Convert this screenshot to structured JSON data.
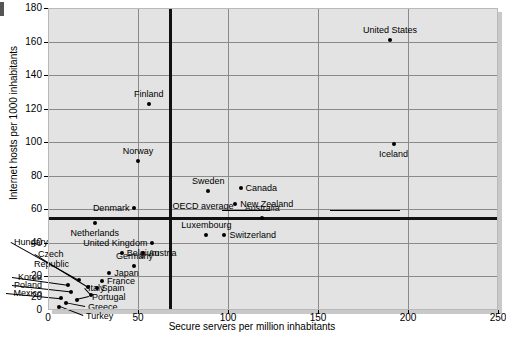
{
  "chart_data": {
    "type": "scatter",
    "title": "",
    "xlabel": "Secure servers per million inhabitants",
    "ylabel": "Internet hosts per 1000 inhabitants",
    "xlim": [
      0,
      250
    ],
    "ylim": [
      0,
      180
    ],
    "xticks": [
      "0",
      "50",
      "100",
      "150",
      "200",
      "250"
    ],
    "xtick_values": [
      0,
      50,
      100,
      150,
      200,
      250
    ],
    "yticks": [
      "0",
      "20",
      "40",
      "60",
      "80",
      "100",
      "120",
      "140",
      "160",
      "180"
    ],
    "ytick_values": [
      0,
      20,
      40,
      60,
      80,
      100,
      120,
      140,
      160,
      180
    ],
    "grid": true,
    "legend": "none",
    "reference_lines": {
      "label": "OECD average",
      "x": 68,
      "y": 55
    },
    "points": [
      {
        "name": "United States",
        "x": 190,
        "y": 161,
        "label_pos": "above"
      },
      {
        "name": "Iceland",
        "x": 192,
        "y": 99,
        "label_pos": "below"
      },
      {
        "name": "Finland",
        "x": 56,
        "y": 123,
        "label_pos": "above"
      },
      {
        "name": "Norway",
        "x": 50,
        "y": 89,
        "label_pos": "above"
      },
      {
        "name": "Sweden",
        "x": 89,
        "y": 71,
        "label_pos": "above"
      },
      {
        "name": "Canada",
        "x": 107,
        "y": 73,
        "label_pos": "right"
      },
      {
        "name": "New Zealand",
        "x": 104,
        "y": 63,
        "label_pos": "right"
      },
      {
        "name": "Australia",
        "x": 119,
        "y": 55,
        "label_pos": "above"
      },
      {
        "name": "Denmark",
        "x": 48,
        "y": 61,
        "label_pos": "left"
      },
      {
        "name": "Netherlands",
        "x": 26,
        "y": 52,
        "label_pos": "below"
      },
      {
        "name": "Luxembourg",
        "x": 88,
        "y": 45,
        "label_pos": "above"
      },
      {
        "name": "Switzerland",
        "x": 98,
        "y": 45,
        "label_pos": "right"
      },
      {
        "name": "United Kingdom",
        "x": 58,
        "y": 40,
        "label_pos": "left"
      },
      {
        "name": "Belgium",
        "x": 41,
        "y": 34,
        "label_pos": "right"
      },
      {
        "name": "Austria",
        "x": 53,
        "y": 34,
        "label_pos": "right"
      },
      {
        "name": "Germany",
        "x": 48,
        "y": 26,
        "label_pos": "above"
      },
      {
        "name": "Hungary",
        "x": 17,
        "y": 18,
        "label_pos": "leader"
      },
      {
        "name": "Czech Republic",
        "x": 22,
        "y": 14,
        "label_pos": "leader"
      },
      {
        "name": "Japan",
        "x": 34,
        "y": 22,
        "label_pos": "right"
      },
      {
        "name": "France",
        "x": 30,
        "y": 17,
        "label_pos": "right"
      },
      {
        "name": "Spain",
        "x": 27,
        "y": 13,
        "label_pos": "right"
      },
      {
        "name": "Italy",
        "x": 24,
        "y": 9,
        "label_pos": "leader"
      },
      {
        "name": "Korea",
        "x": 11,
        "y": 15,
        "label_pos": "leader"
      },
      {
        "name": "Poland",
        "x": 13,
        "y": 11,
        "label_pos": "leader"
      },
      {
        "name": "Mexico",
        "x": 7,
        "y": 7,
        "label_pos": "leader"
      },
      {
        "name": "Portugal",
        "x": 16,
        "y": 6,
        "label_pos": "leader"
      },
      {
        "name": "Greece",
        "x": 10,
        "y": 4,
        "label_pos": "leader"
      },
      {
        "name": "Turkey",
        "x": 6,
        "y": 2,
        "label_pos": "leader"
      }
    ],
    "stray_tick_label": "20"
  },
  "colors": {
    "plot_background": "#e3e3e3",
    "gridline": "#8a8a8a",
    "reference_line": "#111111",
    "marker": "#000000",
    "page_background": "#ffffff"
  }
}
